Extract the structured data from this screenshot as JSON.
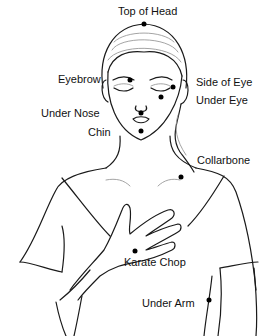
{
  "diagram": {
    "points": [
      {
        "label": "Top of Head",
        "x": 144,
        "y": 24
      },
      {
        "label": "Eyebrow",
        "x": 130,
        "y": 80
      },
      {
        "label": "Side of Eye",
        "x": 173,
        "y": 87
      },
      {
        "label": "Under Eye",
        "x": 161,
        "y": 97
      },
      {
        "label": "Under Nose",
        "x": 141,
        "y": 113
      },
      {
        "label": "Chin",
        "x": 141,
        "y": 131
      },
      {
        "label": "Collarbone",
        "x": 181,
        "y": 177
      },
      {
        "label": "Karate Chop",
        "x": 135,
        "y": 251
      },
      {
        "label": "Under Arm",
        "x": 209,
        "y": 300
      }
    ],
    "colors": {
      "line": "#1a1a1a",
      "dot": "#000000",
      "background": "#ffffff"
    }
  }
}
